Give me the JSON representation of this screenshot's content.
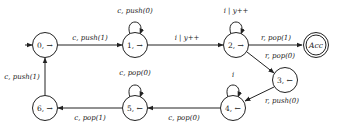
{
  "diagram": {
    "type": "state-machine",
    "nodes": [
      {
        "id": "0",
        "label": "0, →",
        "x": 45,
        "y": 45,
        "initial": true
      },
      {
        "id": "1",
        "label": "1, →",
        "x": 135,
        "y": 45
      },
      {
        "id": "2",
        "label": "2, →",
        "x": 236,
        "y": 45
      },
      {
        "id": "acc",
        "label": "Acc",
        "x": 316,
        "y": 45,
        "accepting": true
      },
      {
        "id": "3",
        "label": "3, ←",
        "x": 285,
        "y": 80
      },
      {
        "id": "4",
        "label": "4, ←",
        "x": 233,
        "y": 108
      },
      {
        "id": "5",
        "label": "5, ←",
        "x": 135,
        "y": 108
      },
      {
        "id": "6",
        "label": "6, →",
        "x": 45,
        "y": 108
      }
    ],
    "edges": [
      {
        "from": "0",
        "to": "1",
        "label": "c, push(1)"
      },
      {
        "from": "1",
        "to": "1",
        "label": "c, push(0)"
      },
      {
        "from": "1",
        "to": "2",
        "label": "i | y++"
      },
      {
        "from": "2",
        "to": "2",
        "label": "i | y++"
      },
      {
        "from": "2",
        "to": "acc",
        "label": "r, pop(1)"
      },
      {
        "from": "2",
        "to": "3",
        "label": "r, pop(0)"
      },
      {
        "from": "3",
        "to": "4",
        "label": "r, push(0)"
      },
      {
        "from": "4",
        "to": "4",
        "label": "i"
      },
      {
        "from": "4",
        "to": "5",
        "label": "c, pop(0)"
      },
      {
        "from": "5",
        "to": "5",
        "label": "c, pop(0)"
      },
      {
        "from": "5",
        "to": "6",
        "label": "c, pop(1)"
      },
      {
        "from": "6",
        "to": "0",
        "label": "c, push(1)"
      }
    ]
  }
}
